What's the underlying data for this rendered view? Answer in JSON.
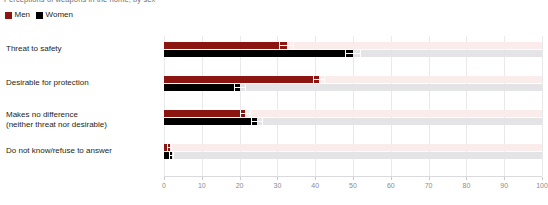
{
  "title_clipped": "Perceptions of weapons in the home, by sex",
  "legend": {
    "position": "top-left",
    "items": [
      {
        "label": "Men",
        "color": "#8c1411",
        "icon": "square-swatch"
      },
      {
        "label": "Women",
        "color": "#000000",
        "icon": "square-swatch"
      }
    ]
  },
  "axis": {
    "x_ticks": [
      "0",
      "10",
      "20",
      "30",
      "40",
      "50",
      "60",
      "70",
      "80",
      "90",
      "100"
    ]
  },
  "chart_data": {
    "type": "bar",
    "orientation": "horizontal",
    "title": "Perceptions of weapons in the home, by sex",
    "xlabel": "",
    "ylabel": "",
    "xlim": [
      0,
      100
    ],
    "xticks": [
      0,
      10,
      20,
      30,
      40,
      50,
      60,
      70,
      80,
      90,
      100
    ],
    "grid": true,
    "legend_position": "top-left",
    "categories": [
      "Threat to safety",
      "Desirable for protection",
      "Makes no difference\n(neither threat nor desirable)",
      "Do not know/refuse to answer"
    ],
    "series": [
      {
        "name": "Men",
        "color": "#8c1411",
        "values": [
          32.5,
          41.0,
          21.5,
          1.5
        ],
        "errors": [
          2.0,
          1.5,
          1.5,
          0.6
        ]
      },
      {
        "name": "Women",
        "color": "#000000",
        "values": [
          50.0,
          20.0,
          24.5,
          2.0
        ],
        "errors": [
          2.2,
          1.6,
          1.6,
          0.7
        ]
      }
    ]
  }
}
